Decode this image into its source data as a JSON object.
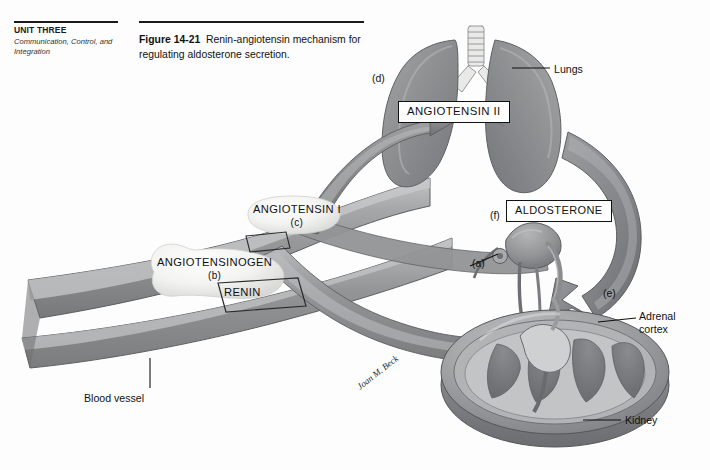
{
  "page": {
    "unit_label": "UNIT THREE",
    "unit_subtitle": "Communication, Control, and Integration",
    "background_color": "#fdfdfd",
    "ink_color": "#111111"
  },
  "caption": {
    "figure_number": "Figure 14-21",
    "text": "Renin-angiotensin mechanism for regulating aldosterone secretion."
  },
  "figure": {
    "artist_signature": "Joan M. Beck",
    "palette": {
      "organ_gray": "#8f9092",
      "organ_gray_dark": "#6e7073",
      "organ_gray_light": "#b8b9bb",
      "vessel_gray": "#97989a",
      "highlight_white": "#f2f2f0",
      "outline": "#3a3b3d"
    },
    "boxed_terms": [
      {
        "id": "angiotensin-2",
        "label": "ANGIOTENSIN II"
      },
      {
        "id": "aldosterone",
        "label": "ALDOSTERONE"
      }
    ],
    "inline_terms": [
      {
        "id": "angiotensin-1",
        "label": "ANGIOTENSIN I",
        "step": "(c)"
      },
      {
        "id": "angiotensinogen",
        "label": "ANGIOTENSINOGEN",
        "step": "(b)"
      },
      {
        "id": "renin",
        "label": "RENIN",
        "step": ""
      }
    ],
    "anatomy_labels": [
      {
        "id": "lungs",
        "label": "Lungs"
      },
      {
        "id": "adrenal-cortex",
        "label": "Adrenal cortex"
      },
      {
        "id": "kidney",
        "label": "Kidney"
      },
      {
        "id": "blood-vessel",
        "label": "Blood vessel"
      }
    ],
    "step_callouts": [
      {
        "id": "a",
        "label": "(a)"
      },
      {
        "id": "b",
        "label": "(b)"
      },
      {
        "id": "c",
        "label": "(c)"
      },
      {
        "id": "d",
        "label": "(d)"
      },
      {
        "id": "e",
        "label": "(e)"
      },
      {
        "id": "f",
        "label": "(f)"
      }
    ]
  }
}
